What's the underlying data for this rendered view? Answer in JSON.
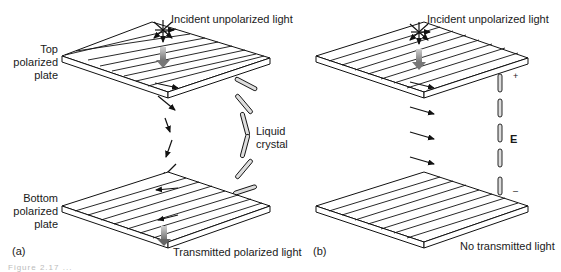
{
  "panel_a": {
    "id_label": "(a)",
    "incident_label": "Incident unpolarized light",
    "top_plate_label": [
      "Top",
      "polarized",
      "plate"
    ],
    "bottom_plate_label": [
      "Bottom",
      "polarized",
      "plate"
    ],
    "liquid_crystal_label": [
      "Liquid",
      "crystal"
    ],
    "transmitted_label": "Transmitted polarized light"
  },
  "panel_b": {
    "id_label": "(b)",
    "incident_label": "Incident unpolarized light",
    "field_label": "E",
    "plus_label": "+",
    "minus_label": "–",
    "transmitted_label": "No transmitted light"
  },
  "caption": "Figure 2.17 ..."
}
